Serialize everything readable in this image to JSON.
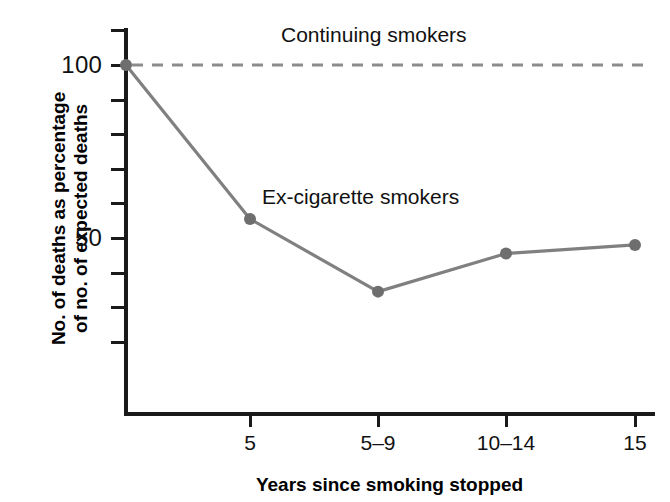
{
  "chart_data": {
    "type": "line",
    "title": "",
    "xlabel": "Years since smoking stopped",
    "ylabel": "No. of deaths as percentage of no. of expected deaths",
    "ylabel_line1": "No. of deaths as percentage",
    "ylabel_line2": "of no. of expected deaths",
    "categories": [
      "0",
      "5",
      "5–9",
      "10–14",
      "15"
    ],
    "xtick_labels": [
      "5",
      "5–9",
      "10–14",
      "15"
    ],
    "ytick_labels": [
      "100",
      "50"
    ],
    "ytick_values": [
      100,
      50
    ],
    "ylim": [
      20,
      110
    ],
    "grid": false,
    "legend_position": "inline-annotation",
    "series": [
      {
        "name": "Ex-cigarette smokers",
        "style": "solid",
        "color": "#808080",
        "markers": true,
        "x": [
          "0",
          "5",
          "5–9",
          "10–14",
          "15"
        ],
        "values": [
          100,
          55.5,
          34.5,
          45.5,
          48
        ]
      },
      {
        "name": "Continuing smokers",
        "style": "dashed",
        "color": "#8c8c8c",
        "markers": false,
        "x": [
          "0",
          "15"
        ],
        "values": [
          100,
          100
        ]
      }
    ],
    "annotations": [
      {
        "id": "continuing",
        "text": "Continuing smokers"
      },
      {
        "id": "ex",
        "text": "Ex-cigarette smokers"
      }
    ]
  },
  "axes": {
    "y_ticks": [
      {
        "label": "100",
        "value": 100,
        "labeled": true
      },
      {
        "label": "",
        "value": 110,
        "labeled": false
      },
      {
        "label": "",
        "value": 90,
        "labeled": false
      },
      {
        "label": "",
        "value": 80,
        "labeled": false
      },
      {
        "label": "",
        "value": 70,
        "labeled": false
      },
      {
        "label": "",
        "value": 60,
        "labeled": false
      },
      {
        "label": "50",
        "value": 50,
        "labeled": true
      },
      {
        "label": "",
        "value": 40,
        "labeled": false
      },
      {
        "label": "",
        "value": 30,
        "labeled": false
      },
      {
        "label": "",
        "value": 20,
        "labeled": false
      }
    ]
  },
  "colors": {
    "axis": "#1a1a1a",
    "line": "#808080",
    "dashed_line": "#8c8c8c",
    "marker": "#6e6e6e",
    "text": "#111111",
    "background": "#ffffff"
  }
}
